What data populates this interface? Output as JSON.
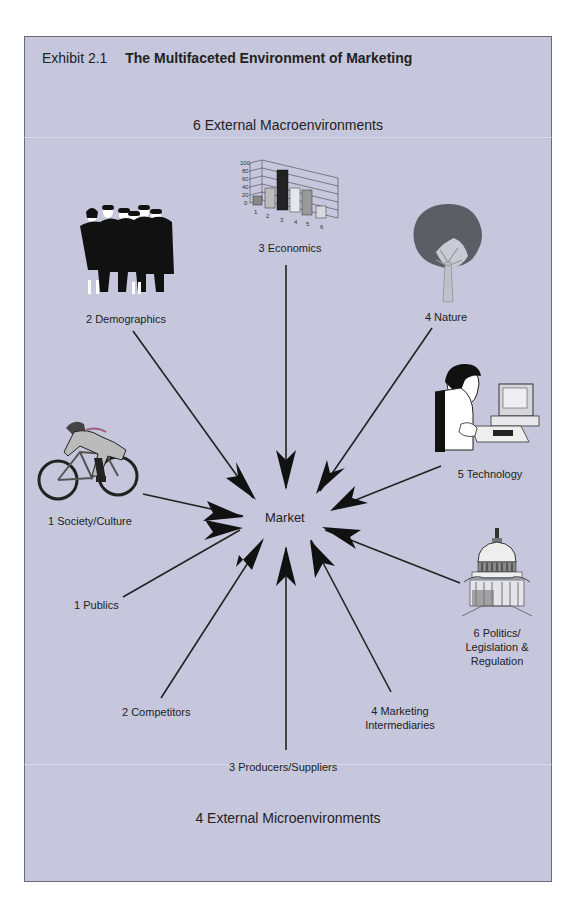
{
  "exhibit": {
    "number": "Exhibit 2.1",
    "title": "The Multifaceted Environment of Marketing"
  },
  "macro_header": "6  External Macroenvironments",
  "micro_header": "4 External Microenvironments",
  "center_label": "Market",
  "macro_nodes": [
    {
      "id": "society",
      "label": "1  Society/Culture",
      "icon": "cyclist-icon"
    },
    {
      "id": "demographics",
      "label": "2  Demographics",
      "icon": "people-group-icon"
    },
    {
      "id": "economics",
      "label": "3  Economics",
      "icon": "bar-chart-icon"
    },
    {
      "id": "nature",
      "label": "4  Nature",
      "icon": "tree-icon"
    },
    {
      "id": "technology",
      "label": "5  Technology",
      "icon": "computer-user-icon"
    },
    {
      "id": "politics",
      "label_lines": [
        "6  Politics/",
        "Legislation &",
        "Regulation"
      ],
      "icon": "capitol-building-icon"
    }
  ],
  "micro_nodes": [
    {
      "id": "publics",
      "label": "1  Publics"
    },
    {
      "id": "competitors",
      "label": "2  Competitors"
    },
    {
      "id": "producers",
      "label": "3  Producers/Suppliers"
    },
    {
      "id": "intermediaries",
      "label_lines": [
        "4  Marketing",
        "Intermediaries"
      ]
    }
  ],
  "economics_chart": {
    "y_ticks": [
      "100",
      "80",
      "60",
      "40",
      "20",
      "0"
    ],
    "x_ticks": [
      "1",
      "2",
      "3",
      "4",
      "5",
      "6"
    ]
  },
  "colors": {
    "background": "#c6c7dd",
    "border": "#6a6a78",
    "arrow": "#111111",
    "text": "#222222"
  }
}
